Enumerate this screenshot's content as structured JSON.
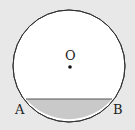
{
  "diagram": {
    "type": "circle-segment",
    "background": "#e8e8e8",
    "circle": {
      "cx": 69,
      "cy": 66,
      "r": 56,
      "fill": "#ffffff",
      "stroke": "#333333"
    },
    "center": {
      "label": "O",
      "x": 69,
      "y": 67
    },
    "chord": {
      "y": 99,
      "x1": 26,
      "x2": 112,
      "stroke": "#555555"
    },
    "segment_fill": "#c9c9c9",
    "points": [
      {
        "label": "A",
        "x": 16,
        "y": 114
      },
      {
        "label": "B",
        "x": 114,
        "y": 114
      }
    ]
  }
}
